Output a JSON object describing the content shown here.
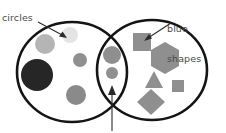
{
  "diagram": {
    "type": "venn",
    "title": "",
    "sets": [
      {
        "id": "left",
        "label": "circles",
        "label_text": "circles",
        "outline_color": "#1a1a1a",
        "center_x": 72,
        "center_y": 72,
        "radius_x": 55,
        "radius_y": 50
      },
      {
        "id": "right",
        "label": "blue shapes",
        "label_line1": "blue",
        "label_line2": "shapes",
        "outline_color": "#1a1a1a",
        "center_x": 152,
        "center_y": 70,
        "radius_x": 55,
        "radius_y": 50
      }
    ],
    "labels": {
      "left_label": "circles",
      "right_label_line1": "blue",
      "right_label_line2": "shapes",
      "text_color": "#4a4a4a"
    },
    "annotations": [
      {
        "name": "arrow-to-circles-region",
        "from_x": 38,
        "from_y": 22,
        "to_x": 66,
        "to_y": 38,
        "color": "#2b2b2b"
      },
      {
        "name": "arrow-to-blue-shapes-region",
        "from_x": 172,
        "from_y": 22,
        "to_x": 145,
        "to_y": 40,
        "color": "#2b2b2b"
      },
      {
        "name": "arrow-to-intersection",
        "from_x": 112,
        "from_y": 131,
        "to_x": 112,
        "to_y": 88,
        "color": "#2b2b2b"
      }
    ],
    "items_left_only": [
      {
        "shape": "circle",
        "cx": 45,
        "cy": 44,
        "r": 10,
        "fill": "#b3b3b3"
      },
      {
        "shape": "circle",
        "cx": 70,
        "cy": 35,
        "r": 8,
        "fill": "#e2e2e2"
      },
      {
        "shape": "circle",
        "cx": 37,
        "cy": 75,
        "r": 16,
        "fill": "#262626"
      },
      {
        "shape": "circle",
        "cx": 80,
        "cy": 60,
        "r": 7,
        "fill": "#8f8f8f"
      },
      {
        "shape": "circle",
        "cx": 76,
        "cy": 95,
        "r": 10,
        "fill": "#8a8a8a"
      }
    ],
    "items_intersection": [
      {
        "shape": "circle",
        "cx": 112,
        "cy": 55,
        "r": 9,
        "fill": "#8f8f8f"
      },
      {
        "shape": "circle",
        "cx": 112,
        "cy": 73,
        "r": 6,
        "fill": "#8f8f8f"
      }
    ],
    "items_right_only": [
      {
        "shape": "square",
        "cx": 142,
        "cy": 42,
        "size": 18,
        "fill": "#8f8f8f"
      },
      {
        "shape": "hexagon",
        "cx": 165,
        "cy": 58,
        "size": 16,
        "fill": "#8f8f8f"
      },
      {
        "shape": "triangle",
        "cx": 154,
        "cy": 81,
        "size": 10,
        "fill": "#8f8f8f"
      },
      {
        "shape": "square",
        "cx": 178,
        "cy": 86,
        "size": 11,
        "fill": "#8f8f8f"
      },
      {
        "shape": "diamond",
        "cx": 151,
        "cy": 102,
        "size": 14,
        "fill": "#8f8f8f"
      }
    ],
    "counts": {
      "left_only": 5,
      "intersection": 2,
      "right_only": 5
    }
  }
}
